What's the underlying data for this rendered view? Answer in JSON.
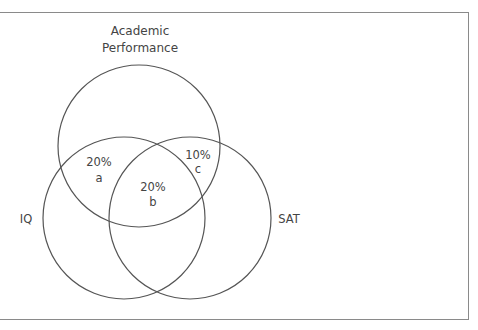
{
  "diagram": {
    "type": "venn",
    "sets": [
      {
        "id": "academic",
        "label_lines": [
          "Academic",
          "Performance"
        ]
      },
      {
        "id": "iq",
        "label": "IQ"
      },
      {
        "id": "sat",
        "label": "SAT"
      }
    ],
    "regions": [
      {
        "id": "a",
        "sets": [
          "academic",
          "iq"
        ],
        "value": "20%",
        "letter": "a"
      },
      {
        "id": "b",
        "sets": [
          "academic",
          "iq",
          "sat"
        ],
        "value": "20%",
        "letter": "b"
      },
      {
        "id": "c",
        "sets": [
          "academic",
          "sat"
        ],
        "value": "10%",
        "letter": "c"
      }
    ],
    "colors": {
      "stroke": "#555555",
      "text": "#444444",
      "frame": "#8a8a8a",
      "background": "#ffffff"
    }
  }
}
